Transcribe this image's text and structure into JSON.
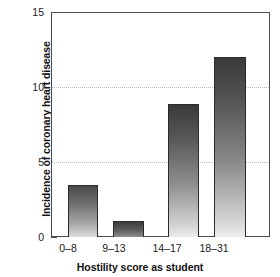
{
  "chart_data": {
    "type": "bar",
    "title": "",
    "subtitle": "",
    "xlabel": "Hostility score as student",
    "ylabel_line1": "Incidence of coronary heart disease",
    "ylabel_line2": "25 years later",
    "categories": [
      "0–8",
      "9–13",
      "14–17",
      "18–31"
    ],
    "values": [
      3.5,
      1.1,
      8.9,
      12.0
    ],
    "series": [
      {
        "name": "Incidence of coronary heart disease 25 years later",
        "values": [
          3.5,
          1.1,
          8.9,
          12.0
        ]
      }
    ],
    "ylim": [
      0,
      15
    ],
    "yticks": [
      0,
      5,
      10,
      15
    ],
    "ytick_labels": [
      "0",
      "5",
      "10",
      "15"
    ],
    "gridlines": {
      "horizontal_at": [
        5,
        10
      ],
      "style": "dotted",
      "color": "#b9b9b9",
      "vertical": false
    },
    "legend": {
      "visible": false,
      "position": "none",
      "entries": []
    },
    "bar_style": {
      "fill": "vertical-gradient-dark-to-light",
      "outline_color": "#2b2b2b",
      "dark": "#3a3a3a",
      "light": "#ececec"
    },
    "axis_color": "#4a4a4a",
    "background": "#ffffff"
  }
}
